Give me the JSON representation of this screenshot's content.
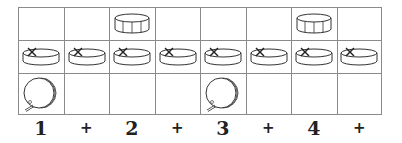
{
  "diagram": {
    "rows": [
      {
        "instrument": "snare",
        "icon": "snare-drum-icon",
        "hits": [
          false,
          false,
          true,
          false,
          false,
          false,
          true,
          false
        ]
      },
      {
        "instrument": "hi-hat",
        "icon": "hi-hat-icon",
        "hits": [
          true,
          true,
          true,
          true,
          true,
          true,
          true,
          true
        ]
      },
      {
        "instrument": "bass-drum",
        "icon": "bass-drum-icon",
        "hits": [
          true,
          false,
          false,
          false,
          true,
          false,
          false,
          false
        ]
      }
    ],
    "counts": [
      "1",
      "+",
      "2",
      "+",
      "3",
      "+",
      "4",
      "+"
    ]
  },
  "colors": {
    "grid_line": "#8a8a8a",
    "icon_stroke": "#333333",
    "count_text": "#222222"
  }
}
